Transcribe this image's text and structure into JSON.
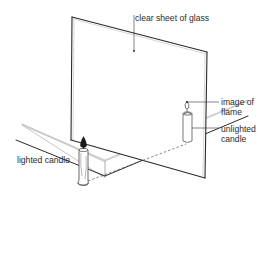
{
  "figure": {
    "labels": {
      "glass": "clear sheet of glass",
      "image_line1": "image of",
      "image_line2": "flame",
      "unlit_line1": "unlighted",
      "unlit_line2": "candle",
      "lit": "lighted candle"
    },
    "colors": {
      "line": "#2a2a2a",
      "light_line": "#9a9a9a",
      "background": "#ffffff"
    }
  }
}
